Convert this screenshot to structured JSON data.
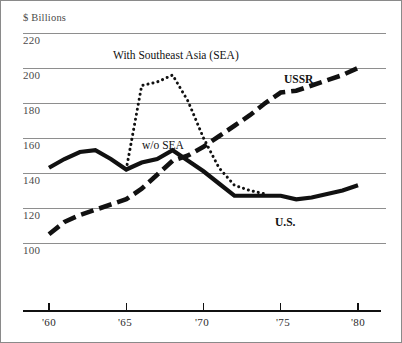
{
  "figure": {
    "background": "#ffffff",
    "frame_color": "#8a8a8a",
    "axis_unit_label": "$ Billions"
  },
  "annotations": {
    "title": "With Southeast Asia (SEA)",
    "series_us": "U.S.",
    "series_ussr": "USSR",
    "series_wo_sea": "w/o SEA"
  },
  "chart_data": {
    "type": "line",
    "title": "With Southeast Asia (SEA)",
    "xlabel": "",
    "ylabel": "$ Billions",
    "xlim": [
      1959,
      1981
    ],
    "ylim": [
      93,
      226
    ],
    "yticks": [
      100,
      120,
      140,
      160,
      180,
      200,
      220
    ],
    "ytick_labels": [
      "100",
      "120",
      "140",
      "160",
      "180",
      "200",
      "220"
    ],
    "xticks": [
      1960,
      1965,
      1970,
      1975,
      1980
    ],
    "xtick_labels": [
      "'60",
      "'65",
      "'70",
      "'75",
      "'80"
    ],
    "grid": "horizontal",
    "legend": "inline-annotations",
    "series": [
      {
        "name": "U.S.",
        "style": "solid",
        "color": "#111111",
        "linewidth": 4.2,
        "x": [
          1960,
          1961,
          1962,
          1963,
          1964,
          1965,
          1966,
          1967,
          1968,
          1969,
          1970,
          1971,
          1972,
          1973,
          1974,
          1975,
          1976,
          1977,
          1978,
          1979,
          1980
        ],
        "values": [
          143,
          148,
          152,
          153,
          148,
          142,
          146,
          148,
          153,
          147,
          141,
          134,
          127,
          127,
          127,
          127,
          125,
          126,
          128,
          130,
          133
        ]
      },
      {
        "name": "USSR",
        "style": "dashed",
        "color": "#111111",
        "linewidth": 4.6,
        "x": [
          1960,
          1961,
          1962,
          1963,
          1964,
          1965,
          1966,
          1967,
          1968,
          1969,
          1970,
          1971,
          1972,
          1973,
          1974,
          1975,
          1976,
          1977,
          1978,
          1979,
          1980
        ],
        "values": [
          105,
          112,
          116,
          119,
          122,
          125,
          131,
          139,
          147,
          150,
          155,
          161,
          167,
          173,
          180,
          186,
          187,
          190,
          193,
          196,
          200
        ]
      },
      {
        "name": "w/o SEA",
        "style": "dotted",
        "color": "#111111",
        "linewidth": 3.0,
        "x": [
          1965,
          1966,
          1967,
          1968,
          1969,
          1970,
          1971,
          1972,
          1973,
          1974
        ],
        "values": [
          142,
          190,
          192,
          196,
          181,
          160,
          143,
          133,
          130,
          128
        ]
      }
    ]
  }
}
